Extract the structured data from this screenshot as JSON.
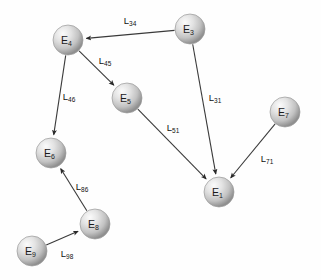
{
  "diagram": {
    "background_color": "#fefefe",
    "node_fill_light": "#f2f2f2",
    "node_fill_dark": "#8c8c8c",
    "edge_color": "#3a3a3a",
    "label_color": "#111111",
    "node_radius": 15,
    "nodes": [
      {
        "id": "E1",
        "base": "E",
        "sub": "1",
        "cx": 219,
        "cy": 192
      },
      {
        "id": "E3",
        "base": "E",
        "sub": "3",
        "cx": 190,
        "cy": 29
      },
      {
        "id": "E4",
        "base": "E",
        "sub": "4",
        "cx": 68,
        "cy": 40
      },
      {
        "id": "E5",
        "base": "E",
        "sub": "5",
        "cx": 127,
        "cy": 98
      },
      {
        "id": "E6",
        "base": "E",
        "sub": "6",
        "cx": 51,
        "cy": 153
      },
      {
        "id": "E7",
        "base": "E",
        "sub": "7",
        "cx": 285,
        "cy": 112
      },
      {
        "id": "E8",
        "base": "E",
        "sub": "8",
        "cx": 95,
        "cy": 224
      },
      {
        "id": "E9",
        "base": "E",
        "sub": "9",
        "cx": 32,
        "cy": 251
      }
    ],
    "edges": [
      {
        "id": "L34",
        "base": "L",
        "sub": "34",
        "from": "E3",
        "to": "E4",
        "lx": 130,
        "ly": 20
      },
      {
        "id": "L45",
        "base": "L",
        "sub": "45",
        "from": "E4",
        "to": "E5",
        "lx": 105,
        "ly": 60
      },
      {
        "id": "L46",
        "base": "L",
        "sub": "46",
        "from": "E4",
        "to": "E6",
        "lx": 69,
        "ly": 96
      },
      {
        "id": "L31",
        "base": "L",
        "sub": "31",
        "from": "E3",
        "to": "E1",
        "lx": 215,
        "ly": 97
      },
      {
        "id": "L51",
        "base": "L",
        "sub": "51",
        "from": "E5",
        "to": "E1",
        "lx": 173,
        "ly": 127
      },
      {
        "id": "L71",
        "base": "L",
        "sub": "71",
        "from": "E7",
        "to": "E1",
        "lx": 267,
        "ly": 158
      },
      {
        "id": "L86",
        "base": "L",
        "sub": "86",
        "from": "E8",
        "to": "E6",
        "lx": 82,
        "ly": 186
      },
      {
        "id": "L98",
        "base": "L",
        "sub": "98",
        "from": "E9",
        "to": "E8",
        "lx": 67,
        "ly": 253
      }
    ]
  }
}
